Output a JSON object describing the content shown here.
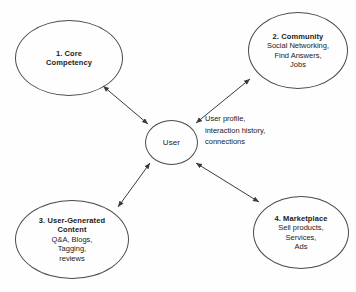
{
  "diagram": {
    "background_color": "#fefefe",
    "stroke_color": "#4a4a4a",
    "text_color": "#1a1a1a",
    "nodes": [
      {
        "id": "core",
        "title": "1. Core",
        "title2": "Competency",
        "lines": []
      },
      {
        "id": "community",
        "title": "2. Community",
        "lines": [
          "Social Networking,",
          "Find Answers,",
          "Jobs"
        ]
      },
      {
        "id": "user",
        "title": "User",
        "lines": []
      },
      {
        "id": "ugc",
        "title": "3. User-Generated",
        "title2": "Content",
        "lines": [
          "Q&A, Blogs,",
          "Tagging,",
          "reviews"
        ]
      },
      {
        "id": "marketplace",
        "title": "4. Marketplace",
        "lines": [
          "Sell products,",
          "Services,",
          "Ads"
        ]
      }
    ],
    "edge_label": {
      "line1": "User profile,",
      "line2": "interaction history,",
      "line3": "connections"
    }
  }
}
